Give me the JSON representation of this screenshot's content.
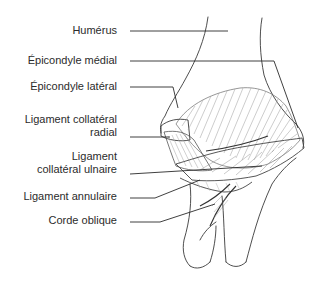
{
  "diagram": {
    "labels": [
      {
        "id": "humerus",
        "lines": [
          "Humérus"
        ]
      },
      {
        "id": "epicondyle-medial",
        "lines": [
          "Épicondyle médial"
        ]
      },
      {
        "id": "epicondyle-lateral",
        "lines": [
          "Épicondyle latéral"
        ]
      },
      {
        "id": "ligament-collateral-radial",
        "lines": [
          "Ligament collatéral",
          "radial"
        ]
      },
      {
        "id": "ligament-collateral-ulnaire",
        "lines": [
          "Ligament",
          "collatéral ulnaire"
        ]
      },
      {
        "id": "ligament-annulaire",
        "lines": [
          "Ligament annulaire"
        ]
      },
      {
        "id": "corde-oblique",
        "lines": [
          "Corde oblique"
        ]
      }
    ],
    "colors": {
      "leader_line": "#2a2a2a",
      "sketch_line": "#3a3a3a",
      "hatching": "#9a9a9a",
      "text": "#2b2b2b",
      "background": "#ffffff"
    }
  }
}
